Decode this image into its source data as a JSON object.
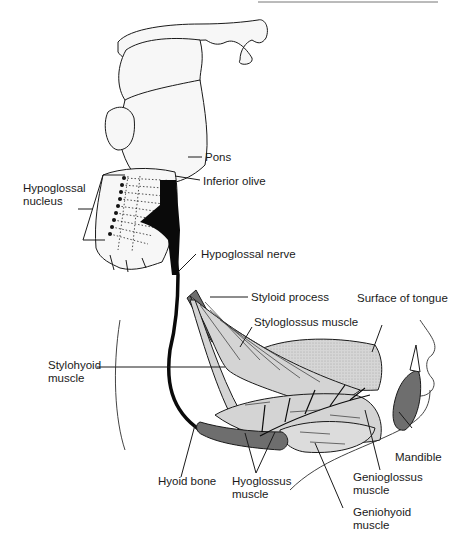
{
  "figure": {
    "type": "anatomical-diagram"
  },
  "labels": {
    "pons": "Pons",
    "inferior_olive": "Inferior olive",
    "hypoglossal_nucleus": "Hypoglossal\nnucleus",
    "hypoglossal_nerve": "Hypoglossal nerve",
    "styloid_process": "Styloid process",
    "surface_of_tongue": "Surface of tongue",
    "styloglossus_muscle": "Styloglossus muscle",
    "stylohyoid_muscle": "Stylohyoid\nmuscle",
    "mandible": "Mandible",
    "hyoid_bone": "Hyoid bone",
    "hyoglossus_muscle": "Hyoglossus\nmuscle",
    "genioglossus_muscle": "Genioglossus\nmuscle",
    "geniohyoid_muscle": "Geniohyoid\nmuscle"
  },
  "colors": {
    "outline": "#1a1a1a",
    "muscle_fill": "#d4d4d4",
    "tongue_fill": "#cfcfcf",
    "bone_fill": "#6e6e6e",
    "nerve": "#0a0a0a",
    "brainstem_fill": "#f7f7f7"
  }
}
